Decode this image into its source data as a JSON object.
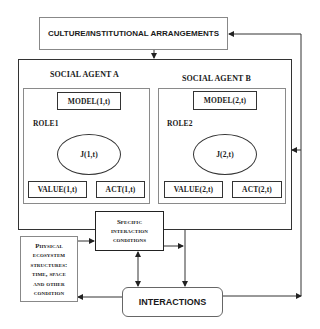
{
  "diagram": {
    "culture_box": {
      "label": "CULTURE/INSTITUTIONAL ARRANGEMENTS"
    },
    "agent_a": {
      "title": "SOCIAL AGENT A",
      "role_label": "ROLE1",
      "model": "MODEL(1,t)",
      "judgement": "J(1,t)",
      "value": "VALUE(1,t)",
      "act": "ACT(1,t)"
    },
    "agent_b": {
      "title": "SOCIAL AGENT B",
      "role_label": "ROLE2",
      "model": "MODEL(2,t)",
      "judgement": "J(2,t)",
      "value": "VALUE(2,t)",
      "act": "ACT(2,t)"
    },
    "specific_box": {
      "line1": "Specific",
      "line2": "interaction",
      "line3": "conditions"
    },
    "physical_box": {
      "line1": "Physical",
      "line2": "ecosystem",
      "line3": "structures:",
      "line4": "time, space",
      "line5": "and other",
      "line6": "condition"
    },
    "interactions_box": {
      "label": "INTERACTIONS"
    },
    "colors": {
      "line": "#333333",
      "inner_border": "#8a8a8a",
      "background": "#ffffff"
    }
  }
}
